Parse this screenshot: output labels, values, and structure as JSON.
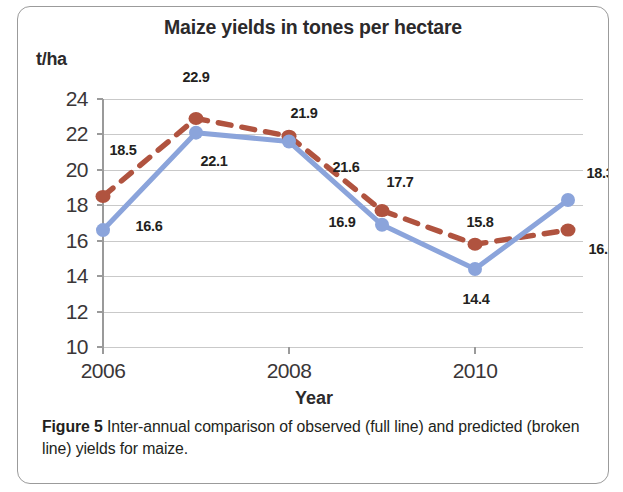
{
  "figure": {
    "caption_label": "Figure 5",
    "caption_text": " Inter-annual comparison of observed (full line) and predicted (broken line) yields for maize."
  },
  "chart_data": {
    "type": "line",
    "title": "Maize yields in tones per hectare",
    "xlabel": "Year",
    "ylabel": "t/ha",
    "ylim": [
      10,
      24
    ],
    "yticks": [
      "10",
      "12",
      "14",
      "16",
      "18",
      "20",
      "22",
      "24"
    ],
    "xticks": [
      "2006",
      "2008",
      "2010"
    ],
    "xtick_values": [
      2006,
      2008,
      2010
    ],
    "x": [
      2006,
      2007,
      2008,
      2009,
      2010,
      2011
    ],
    "grid": true,
    "legend": "none",
    "series": [
      {
        "name": "observed (full line)",
        "style": "solid",
        "color": "#8ba4db",
        "values": [
          16.6,
          22.1,
          21.6,
          16.9,
          14.4,
          18.3
        ],
        "labels": [
          "16.6",
          "22.1",
          "21.6",
          "16.9",
          "14.4",
          "18.3"
        ]
      },
      {
        "name": "predicted (broken line)",
        "style": "dashed",
        "color": "#b0533f",
        "values": [
          18.5,
          22.9,
          21.9,
          17.7,
          15.8,
          16.6
        ],
        "labels": [
          "18.5",
          "22.9",
          "21.9",
          "17.7",
          "15.8",
          "16.6"
        ]
      }
    ]
  }
}
